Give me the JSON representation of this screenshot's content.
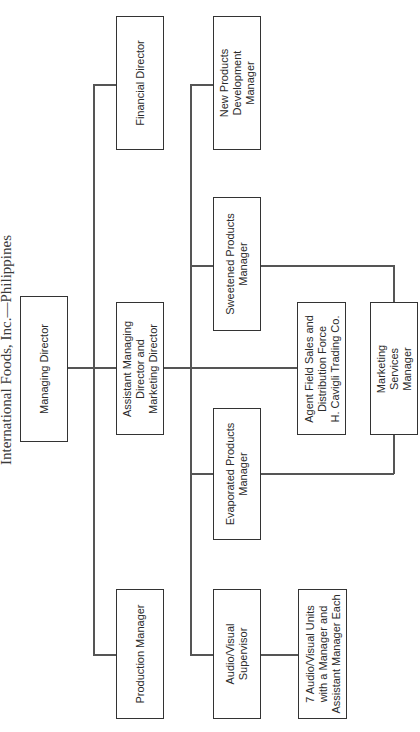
{
  "title": "International Foods, Inc.—Philippines",
  "orientation": "rotated-90-ccw",
  "nodes": {
    "managing_director": "Managing Director",
    "financial_director": "Financial Director",
    "assistant_managing_director": "Assistant Managing\nDirector and\nMarketing Director",
    "production_manager": "Production Manager",
    "new_products_manager": "New Products\nDevelopment\nManager",
    "sweetened_products_manager": "Sweetened Products\nManager",
    "evaporated_products_manager": "Evaporated Products\nManager",
    "audio_visual_supervisor": "Audio/Visual\nSupervisor",
    "agent_field_sales": "Agent Field Sales and\nDistribution Force\nH. Cavigli Trading Co.",
    "marketing_services_manager": "Marketing\nServices\nManager",
    "av_units": "7 Audio/Visual Units\nwith a Manager and\nAssistant Manager Each"
  },
  "edges": [
    [
      "managing_director",
      "financial_director"
    ],
    [
      "managing_director",
      "assistant_managing_director"
    ],
    [
      "managing_director",
      "production_manager"
    ],
    [
      "assistant_managing_director",
      "new_products_manager"
    ],
    [
      "assistant_managing_director",
      "sweetened_products_manager"
    ],
    [
      "assistant_managing_director",
      "agent_field_sales"
    ],
    [
      "assistant_managing_director",
      "evaporated_products_manager"
    ],
    [
      "assistant_managing_director",
      "audio_visual_supervisor"
    ],
    [
      "sweetened_products_manager",
      "marketing_services_manager"
    ],
    [
      "evaporated_products_manager",
      "marketing_services_manager"
    ],
    [
      "audio_visual_supervisor",
      "av_units"
    ]
  ]
}
